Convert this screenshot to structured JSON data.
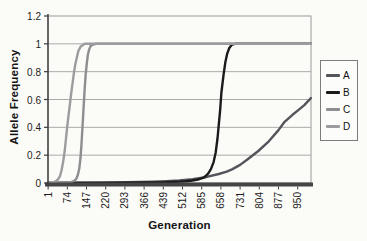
{
  "chart_data": {
    "type": "line",
    "title": "",
    "xlabel": "Generation",
    "ylabel": "Allele Frequency",
    "grid": "horizontal",
    "legend_position": "right",
    "x_axis": {
      "min": 1,
      "max": 1000,
      "tick_values": [
        1,
        74,
        147,
        220,
        293,
        366,
        439,
        512,
        585,
        658,
        731,
        804,
        877,
        950
      ],
      "tick_labels": [
        "1",
        "74",
        "147",
        "220",
        "293",
        "366",
        "439",
        "512",
        "585",
        "658",
        "731",
        "804",
        "877",
        "950"
      ],
      "label_rotation": -90
    },
    "y_axis": {
      "min": 0,
      "max": 1.2,
      "tick_values": [
        0,
        0.2,
        0.4,
        0.6,
        0.8,
        1,
        1.2
      ],
      "tick_labels": [
        "0",
        "0.2",
        "0.4",
        "0.6",
        "0.8",
        "1",
        "1.2"
      ]
    },
    "series": [
      {
        "name": "A",
        "color": "#54555a",
        "points": [
          [
            1,
            0.001
          ],
          [
            100,
            0.002
          ],
          [
            200,
            0.003
          ],
          [
            300,
            0.005
          ],
          [
            400,
            0.009
          ],
          [
            450,
            0.013
          ],
          [
            500,
            0.018
          ],
          [
            550,
            0.028
          ],
          [
            600,
            0.042
          ],
          [
            650,
            0.065
          ],
          [
            680,
            0.082
          ],
          [
            700,
            0.098
          ],
          [
            731,
            0.13
          ],
          [
            760,
            0.17
          ],
          [
            800,
            0.23
          ],
          [
            840,
            0.3
          ],
          [
            877,
            0.38
          ],
          [
            900,
            0.44
          ],
          [
            930,
            0.49
          ],
          [
            950,
            0.52
          ],
          [
            975,
            0.56
          ],
          [
            1000,
            0.61
          ]
        ]
      },
      {
        "name": "B",
        "color": "#1b1b1b",
        "points": [
          [
            1,
            0.001
          ],
          [
            300,
            0.002
          ],
          [
            400,
            0.004
          ],
          [
            450,
            0.006
          ],
          [
            500,
            0.01
          ],
          [
            525,
            0.013
          ],
          [
            550,
            0.018
          ],
          [
            575,
            0.027
          ],
          [
            590,
            0.037
          ],
          [
            600,
            0.05
          ],
          [
            610,
            0.07
          ],
          [
            620,
            0.1
          ],
          [
            630,
            0.15
          ],
          [
            638,
            0.22
          ],
          [
            645,
            0.32
          ],
          [
            650,
            0.42
          ],
          [
            655,
            0.52
          ],
          [
            660,
            0.65
          ],
          [
            668,
            0.78
          ],
          [
            675,
            0.87
          ],
          [
            682,
            0.93
          ],
          [
            690,
            0.97
          ],
          [
            700,
            0.995
          ],
          [
            712,
            1
          ],
          [
            1000,
            1
          ]
        ]
      },
      {
        "name": "C",
        "color": "#8d8e90",
        "points": [
          [
            1,
            0.001
          ],
          [
            60,
            0.002
          ],
          [
            80,
            0.004
          ],
          [
            90,
            0.008
          ],
          [
            100,
            0.015
          ],
          [
            108,
            0.03
          ],
          [
            114,
            0.06
          ],
          [
            119,
            0.1
          ],
          [
            124,
            0.18
          ],
          [
            128,
            0.28
          ],
          [
            131,
            0.38
          ],
          [
            134,
            0.48
          ],
          [
            137,
            0.58
          ],
          [
            140,
            0.68
          ],
          [
            144,
            0.78
          ],
          [
            148,
            0.86
          ],
          [
            152,
            0.92
          ],
          [
            157,
            0.96
          ],
          [
            163,
            0.985
          ],
          [
            172,
            0.995
          ],
          [
            185,
            1
          ],
          [
            1000,
            1
          ]
        ]
      },
      {
        "name": "D",
        "color": "#9b9c9e",
        "points": [
          [
            1,
            0.002
          ],
          [
            15,
            0.004
          ],
          [
            25,
            0.008
          ],
          [
            33,
            0.015
          ],
          [
            40,
            0.03
          ],
          [
            46,
            0.05
          ],
          [
            52,
            0.09
          ],
          [
            58,
            0.15
          ],
          [
            64,
            0.23
          ],
          [
            69,
            0.32
          ],
          [
            74,
            0.41
          ],
          [
            79,
            0.49
          ],
          [
            84,
            0.57
          ],
          [
            89,
            0.65
          ],
          [
            94,
            0.72
          ],
          [
            99,
            0.79
          ],
          [
            104,
            0.85
          ],
          [
            110,
            0.9
          ],
          [
            116,
            0.95
          ],
          [
            125,
            0.98
          ],
          [
            140,
            1
          ],
          [
            1000,
            1
          ]
        ]
      }
    ]
  }
}
